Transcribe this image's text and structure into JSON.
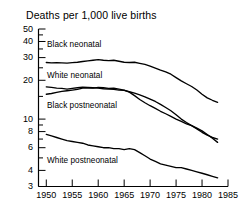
{
  "chart_data": {
    "type": "line",
    "title": "Deaths per 1,000 live births",
    "xlabel": "",
    "ylabel": "Deaths per 1,000 live births",
    "yscale": "log",
    "ylim": [
      3,
      50
    ],
    "xlim": [
      1948.5,
      1985
    ],
    "grid": false,
    "legend_position": "inline-labels",
    "yticks": [
      3,
      4,
      6,
      8,
      10,
      20,
      30,
      40,
      50
    ],
    "ytick_labels": [
      "3",
      "4",
      "6",
      "8",
      "10",
      "20",
      "30",
      "40",
      "50"
    ],
    "yminor_ticks": [
      5,
      7,
      9,
      15,
      25,
      35,
      45
    ],
    "xticks": [
      1950,
      1955,
      1960,
      1965,
      1970,
      1975,
      1980,
      1985
    ],
    "xtick_labels": [
      "1950",
      "1955",
      "1960",
      "1965",
      "1970",
      "1975",
      "1980",
      "1985"
    ],
    "x": [
      1950,
      1951,
      1952,
      1953,
      1954,
      1955,
      1956,
      1957,
      1958,
      1959,
      1960,
      1961,
      1962,
      1963,
      1964,
      1965,
      1966,
      1967,
      1968,
      1969,
      1970,
      1971,
      1972,
      1973,
      1974,
      1975,
      1976,
      1977,
      1978,
      1979,
      1980,
      1981,
      1982,
      1983
    ],
    "series": [
      {
        "name": "Black neonatal",
        "label": "Black neonatal",
        "color": "#000000",
        "values": [
          27.5,
          27.3,
          27.4,
          27.3,
          27.2,
          27.4,
          27.6,
          28.0,
          28.3,
          28.6,
          28.9,
          28.6,
          28.4,
          28.6,
          28.1,
          27.6,
          27.5,
          27.6,
          27.1,
          26.6,
          25.8,
          24.9,
          24.0,
          23.2,
          22.3,
          21.0,
          19.8,
          18.8,
          17.9,
          16.8,
          15.6,
          14.6,
          14.0,
          13.5
        ]
      },
      {
        "name": "White neonatal",
        "label": "White neonatal",
        "color": "#000000",
        "values": [
          17.8,
          17.6,
          17.4,
          17.3,
          17.1,
          17.3,
          17.5,
          17.7,
          17.6,
          17.5,
          17.4,
          17.2,
          17.1,
          17.0,
          16.8,
          16.7,
          16.3,
          15.9,
          15.4,
          14.9,
          14.3,
          13.7,
          13.0,
          12.3,
          11.6,
          10.8,
          10.0,
          9.4,
          8.9,
          8.4,
          7.9,
          7.5,
          7.2,
          7.0
        ]
      },
      {
        "name": "Black postneonatal",
        "label": "Black postneonatal",
        "color": "#000000",
        "values": [
          15.6,
          15.8,
          16.1,
          16.4,
          16.6,
          16.8,
          17.0,
          17.4,
          17.5,
          17.4,
          17.6,
          17.5,
          17.3,
          17.4,
          17.1,
          16.8,
          16.2,
          15.2,
          14.2,
          13.4,
          12.7,
          12.1,
          11.5,
          11.0,
          10.5,
          10.0,
          9.6,
          9.2,
          8.9,
          8.5,
          8.1,
          7.6,
          7.1,
          6.6
        ]
      },
      {
        "name": "White postneonatal",
        "label": "White postneonatal",
        "color": "#000000",
        "values": [
          7.6,
          7.4,
          7.2,
          7.0,
          6.8,
          6.7,
          6.6,
          6.5,
          6.3,
          6.2,
          6.1,
          6.0,
          6.0,
          5.9,
          5.9,
          5.8,
          5.9,
          5.8,
          5.5,
          5.2,
          4.9,
          4.7,
          4.5,
          4.4,
          4.3,
          4.2,
          4.2,
          4.1,
          4.0,
          3.9,
          3.8,
          3.7,
          3.6,
          3.5
        ]
      }
    ],
    "series_label_positions": [
      {
        "label": "Black neonatal",
        "x": 47,
        "y": 40
      },
      {
        "label": "White neonatal",
        "x": 47,
        "y": 71
      },
      {
        "label": "Black postneonatal",
        "x": 47,
        "y": 101
      },
      {
        "label": "White postneonatal",
        "x": 47,
        "y": 156
      }
    ]
  },
  "axes": {
    "axis_color": "#000000"
  }
}
